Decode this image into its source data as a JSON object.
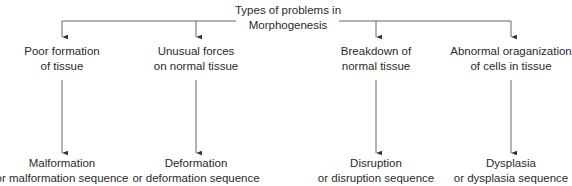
{
  "root": {
    "title_line1": "Types of problems in",
    "title_line2": "Morphogenesis"
  },
  "branches": [
    {
      "cause_line1": "Poor formation",
      "cause_line2": "of tissue",
      "result_line1": "Malformation",
      "result_line2": "or malformation sequence"
    },
    {
      "cause_line1": "Unusual forces",
      "cause_line2": "on normal tissue",
      "result_line1": "Deformation",
      "result_line2": "or deformation sequence"
    },
    {
      "cause_line1": "Breakdown of",
      "cause_line2": "normal tissue",
      "result_line1": "Disruption",
      "result_line2": "or disruption sequence"
    },
    {
      "cause_line1": "Abnormal oraganization",
      "cause_line2": "of cells in tissue",
      "result_line1": "Dysplasia",
      "result_line2": "or dysplasia sequence"
    }
  ],
  "colors": {
    "line": "#555555",
    "text": "#2a2a2a"
  }
}
